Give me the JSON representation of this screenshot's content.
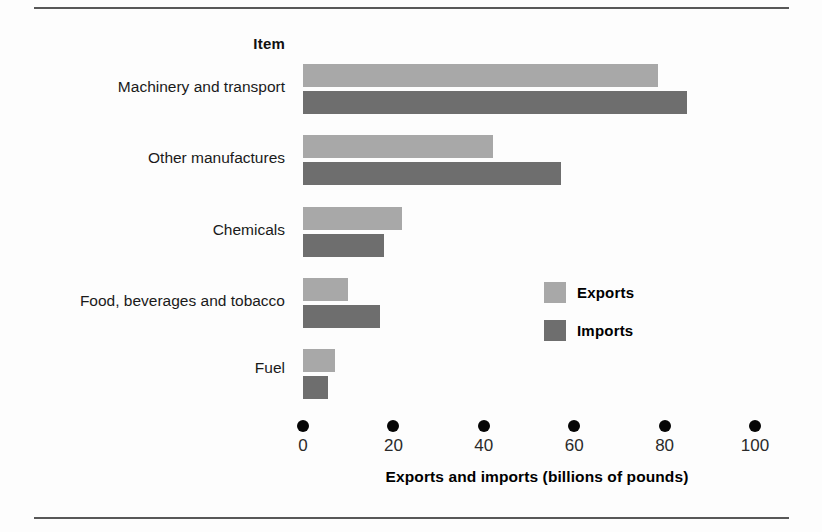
{
  "figure": {
    "column_header": "Item",
    "legend_position": "inside-right",
    "colors": {
      "exports": "#a8a8a8",
      "imports": "#6e6e6e",
      "rule": "#585858",
      "tick": "#050505"
    }
  },
  "legend": {
    "entries": [
      {
        "label": "Exports",
        "color": "#a8a8a8",
        "swatch_name": "legend-swatch-exports"
      },
      {
        "label": "Imports",
        "color": "#6e6e6e",
        "swatch_name": "legend-swatch-imports"
      }
    ]
  },
  "axis": {
    "title": "Exports and imports (billions of pounds)",
    "ticks": [
      "0",
      "20",
      "40",
      "60",
      "80",
      "100"
    ],
    "tick_values": [
      0,
      20,
      40,
      60,
      80,
      100
    ],
    "min": 0,
    "max": 100,
    "tick_style": "dot"
  },
  "chart_data": {
    "type": "bar",
    "orientation": "horizontal",
    "title": "",
    "subtitle": "",
    "xlabel": "Exports and imports (billions of pounds)",
    "ylabel": "Item",
    "categories": [
      "Machinery and transport",
      "Other manufactures",
      "Chemicals",
      "Food, beverages and tobacco",
      "Fuel"
    ],
    "series": [
      {
        "name": "Exports",
        "color": "#a8a8a8",
        "values": [
          78.5,
          42,
          22,
          10,
          7
        ]
      },
      {
        "name": "Imports",
        "color": "#6e6e6e",
        "values": [
          85,
          57,
          18,
          17,
          5.5
        ]
      }
    ],
    "xlim": [
      0,
      100
    ],
    "xticks": [
      0,
      20,
      40,
      60,
      80,
      100
    ],
    "grid": false,
    "legend": [
      "Exports",
      "Imports"
    ],
    "legend_position": "inside-right"
  }
}
